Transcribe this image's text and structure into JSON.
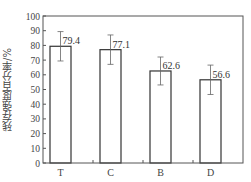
{
  "chart_data": {
    "type": "bar",
    "title": "",
    "xlabel": "",
    "ylabel": "残存强度百分率/%",
    "categories": [
      "T",
      "C",
      "B",
      "D"
    ],
    "values": [
      79.4,
      77.1,
      62.6,
      56.6
    ],
    "error": [
      10,
      10,
      9.5,
      10
    ],
    "value_labels": [
      "79.4",
      "77.1",
      "62.6",
      "56.6"
    ],
    "ylim": [
      0,
      100
    ],
    "yticks": [
      0,
      10,
      20,
      30,
      40,
      50,
      60,
      70,
      80,
      90,
      100
    ],
    "grid": false,
    "legend": null,
    "bar_fill": "#ffffff",
    "bar_edge": "#333333"
  }
}
